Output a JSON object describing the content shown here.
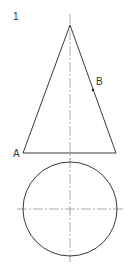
{
  "figure": {
    "number_label": "1",
    "point_a_label": "A",
    "point_b_label": "B",
    "elevation": {
      "description": "cone front elevation",
      "apex": [
        70,
        25
      ],
      "base_left": [
        23,
        153
      ],
      "base_right": [
        116,
        153
      ]
    },
    "plan": {
      "description": "cone plan view (circle)",
      "center": [
        70,
        209
      ],
      "radius": 47
    },
    "point_b": [
      93,
      90
    ],
    "colors": {
      "line": "#3a3a3a",
      "centerline": "#888888",
      "background": "#ffffff"
    }
  }
}
